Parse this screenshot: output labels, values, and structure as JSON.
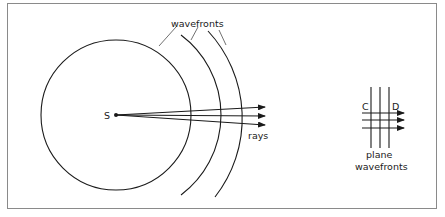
{
  "diagram": {
    "type": "wavefront-diagram",
    "source_label": "S",
    "wavefronts_label": "wavefronts",
    "rays_label": "rays",
    "plane": {
      "label_line1": "plane",
      "label_line2": "wavefronts",
      "left_label": "C",
      "right_label": "D"
    },
    "colors": {
      "ink": "#1a1a1a",
      "frame": "#8a8a8a",
      "background": "#ffffff"
    }
  }
}
